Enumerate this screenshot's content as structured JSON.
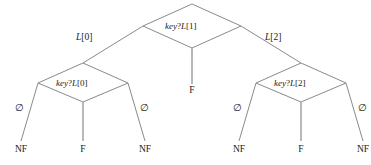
{
  "diagram": {
    "type": "decision-tree",
    "colors": {
      "background": "#ffffff",
      "line": "#8a8a8a",
      "text": "#1a1a1a"
    },
    "nodes": [
      {
        "id": "root",
        "shape": "diamond",
        "keyword": "key",
        "operator": "?",
        "array": "L",
        "index": "[1]",
        "text": "key ? L[1]"
      },
      {
        "id": "left-decision",
        "shape": "diamond",
        "keyword": "key",
        "operator": "?",
        "array": "L",
        "index": "[0]",
        "text": "key ? L[0]"
      },
      {
        "id": "right-decision",
        "shape": "diamond",
        "keyword": "key",
        "operator": "?",
        "array": "L",
        "index": "[2]",
        "text": "key ? L[2]"
      }
    ],
    "edge_labels": [
      {
        "id": "root-left",
        "array": "L",
        "index": "[0]",
        "text": "L[0]"
      },
      {
        "id": "root-right",
        "array": "L",
        "index": "[2]",
        "text": "L[2]"
      }
    ],
    "empty_labels": [
      {
        "id": "left-outer-left",
        "symbol": "∅"
      },
      {
        "id": "left-outer-right",
        "symbol": "∅"
      },
      {
        "id": "right-outer-left",
        "symbol": "∅"
      },
      {
        "id": "right-outer-right",
        "symbol": "∅"
      }
    ],
    "leaves": [
      {
        "id": "leaf-1",
        "text": "NF"
      },
      {
        "id": "leaf-2",
        "text": "F"
      },
      {
        "id": "leaf-3",
        "text": "NF"
      },
      {
        "id": "leaf-root-middle",
        "text": "F"
      },
      {
        "id": "leaf-4",
        "text": "NF"
      },
      {
        "id": "leaf-5",
        "text": "F"
      },
      {
        "id": "leaf-6",
        "text": "NF"
      }
    ]
  }
}
